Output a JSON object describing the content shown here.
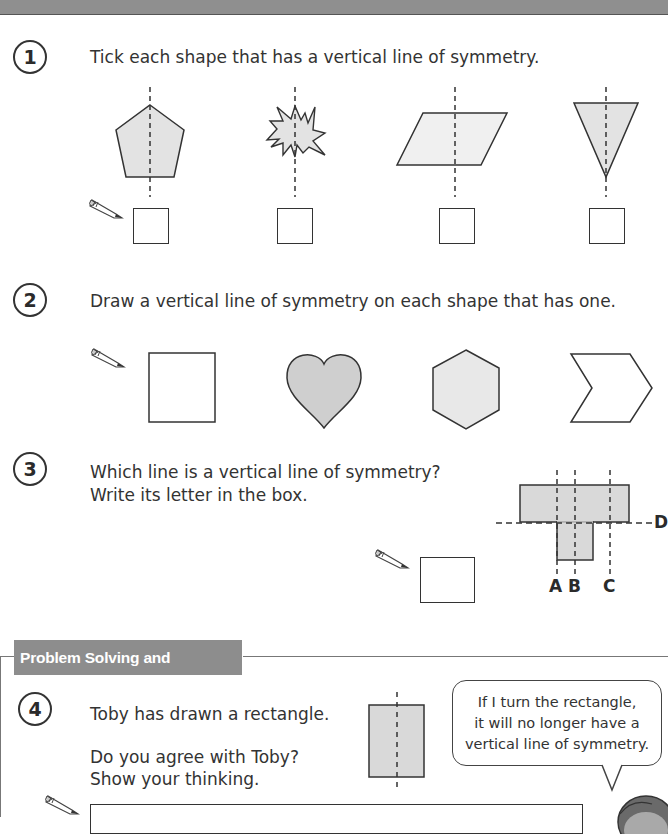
{
  "header": {
    "title_visible": ""
  },
  "questions": [
    {
      "number": "1",
      "text": "Tick each shape that has a vertical line of symmetry.",
      "shapes": [
        "pentagon",
        "starburst",
        "parallelogram",
        "inverted-triangle"
      ]
    },
    {
      "number": "2",
      "text": "Draw a vertical line of symmetry on each shape that has one.",
      "shapes": [
        "rectangle",
        "heart",
        "hexagon",
        "chevron"
      ]
    },
    {
      "number": "3",
      "line1": "Which line is a vertical line of symmetry?",
      "line2": "Write its letter in the box.",
      "labels": {
        "a": "A",
        "b": "B",
        "c": "C",
        "d": "D"
      }
    },
    {
      "number": "4",
      "line1": "Toby has drawn a rectangle.",
      "line2": "Do you agree with Toby?",
      "line3": "Show your thinking.",
      "speech": [
        "If I turn the rectangle,",
        "it will no longer have a",
        "vertical line of symmetry."
      ]
    }
  ],
  "section": {
    "title": "Problem Solving and Reasoning"
  },
  "colors": {
    "header": "#8f8f8f",
    "shape_fill": "#e3e3e3",
    "shape_fill_dark": "#cfcfcf",
    "stroke": "#333333"
  }
}
